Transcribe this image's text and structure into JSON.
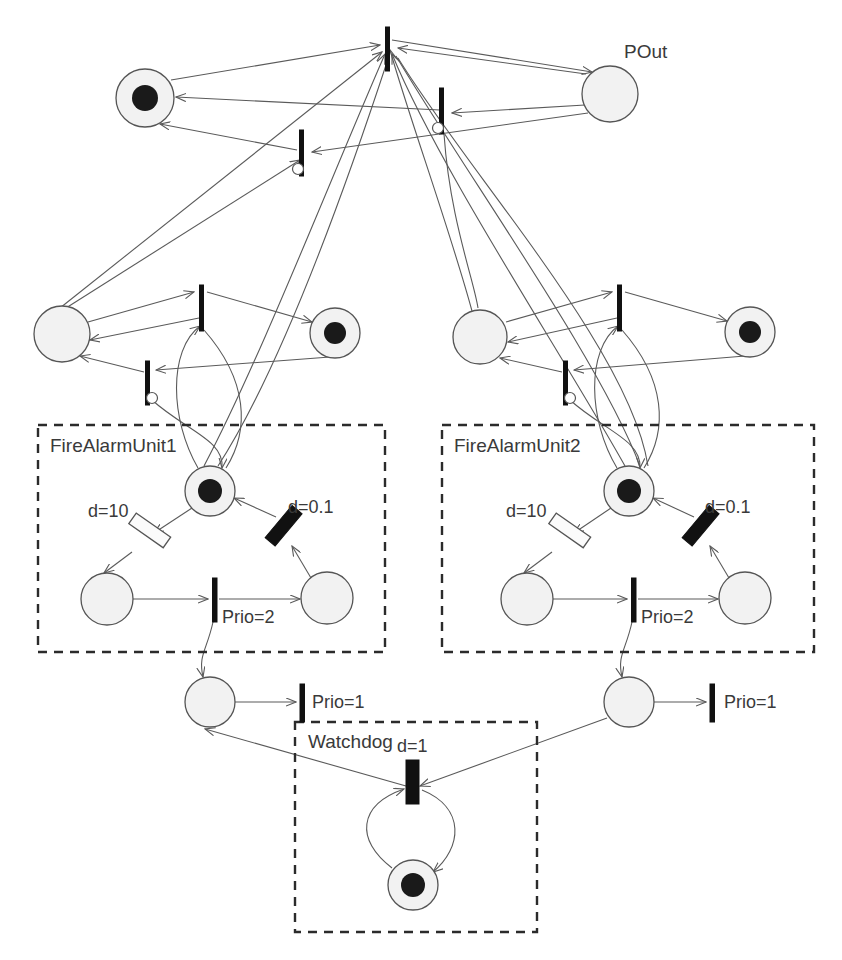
{
  "diagram": {
    "type": "petri-net",
    "colors": {
      "place_fill": "#f2f2f2",
      "place_stroke": "#555555",
      "token": "#1a1a1a",
      "transition_filled": "#111111",
      "transition_hollow": "#fbfbfb",
      "arc": "#5a5a5a",
      "group_border": "#2b2b2b",
      "text": "#3a3a3a",
      "background": "#ffffff"
    }
  },
  "labels": {
    "pout": "POut",
    "fire_alarm_unit_1": "FireAlarmUnit1",
    "fire_alarm_unit_2": "FireAlarmUnit2",
    "watchdog": "Watchdog",
    "d_10_u1": "d=10",
    "d_01_u1": "d=0.1",
    "prio_2_u1": "Prio=2",
    "d_10_u2": "d=10",
    "d_01_u2": "d=0.1",
    "prio_2_u2": "Prio=2",
    "prio_1_left": "Prio=1",
    "prio_1_right": "Prio=1",
    "d_1_watchdog": "d=1"
  },
  "places": [
    {
      "id": "p-top-left",
      "cx": 145,
      "cy": 98,
      "r": 29,
      "tokens": 1,
      "label": ""
    },
    {
      "id": "p-out",
      "cx": 610,
      "cy": 94,
      "r": 28,
      "tokens": 0,
      "label": "POut"
    },
    {
      "id": "p-mid-left-1",
      "cx": 62,
      "cy": 334,
      "r": 28,
      "tokens": 0,
      "label": ""
    },
    {
      "id": "p-mid-right-1",
      "cx": 335,
      "cy": 333,
      "r": 25,
      "tokens": 1,
      "label": ""
    },
    {
      "id": "p-mid-left-2",
      "cx": 480,
      "cy": 337,
      "r": 27,
      "tokens": 0,
      "label": ""
    },
    {
      "id": "p-mid-right-2",
      "cx": 750,
      "cy": 332,
      "r": 25,
      "tokens": 1,
      "label": ""
    },
    {
      "id": "p-u1-top",
      "cx": 210,
      "cy": 491,
      "r": 25,
      "tokens": 1,
      "label": ""
    },
    {
      "id": "p-u1-left",
      "cx": 107,
      "cy": 599,
      "r": 26,
      "tokens": 0,
      "label": ""
    },
    {
      "id": "p-u1-right",
      "cx": 327,
      "cy": 598,
      "r": 26,
      "tokens": 0,
      "label": ""
    },
    {
      "id": "p-u2-top",
      "cx": 629,
      "cy": 491,
      "r": 25,
      "tokens": 1,
      "label": ""
    },
    {
      "id": "p-u2-left",
      "cx": 527,
      "cy": 599,
      "r": 26,
      "tokens": 0,
      "label": ""
    },
    {
      "id": "p-u2-right",
      "cx": 745,
      "cy": 598,
      "r": 26,
      "tokens": 0,
      "label": ""
    },
    {
      "id": "p-bottom-left",
      "cx": 210,
      "cy": 702,
      "r": 25,
      "tokens": 0,
      "label": ""
    },
    {
      "id": "p-bottom-right",
      "cx": 629,
      "cy": 702,
      "r": 25,
      "tokens": 0,
      "label": ""
    },
    {
      "id": "p-watchdog",
      "cx": 413,
      "cy": 885,
      "r": 25,
      "tokens": 1,
      "label": ""
    }
  ],
  "transitions": [
    {
      "id": "t-top-main",
      "x": 388,
      "y": 27,
      "h": 44,
      "style": "thin",
      "label": "",
      "inhibitor": false
    },
    {
      "id": "t-top-right",
      "x": 442,
      "y": 88,
      "h": 46,
      "style": "thin",
      "label": "",
      "inhibitor": true
    },
    {
      "id": "t-top-left",
      "x": 302,
      "y": 130,
      "h": 46,
      "style": "thin",
      "label": "",
      "inhibitor": true
    },
    {
      "id": "t-mid1-up",
      "x": 202,
      "y": 285,
      "h": 46,
      "style": "thin",
      "label": "",
      "inhibitor": false
    },
    {
      "id": "t-mid1-down",
      "x": 148,
      "y": 361,
      "h": 44,
      "style": "thin",
      "label": "",
      "inhibitor": true
    },
    {
      "id": "t-mid2-up",
      "x": 620,
      "y": 285,
      "h": 46,
      "style": "thin",
      "label": "",
      "inhibitor": false
    },
    {
      "id": "t-mid2-down",
      "x": 566,
      "y": 361,
      "h": 44,
      "style": "thin",
      "label": "",
      "inhibitor": true
    },
    {
      "id": "t-u1-d10",
      "x": 141,
      "y": 524,
      "h": 42,
      "style": "hollow",
      "label": "d=10",
      "inhibitor": false
    },
    {
      "id": "t-u1-d01",
      "x": 283,
      "y": 523,
      "h": 42,
      "style": "thick",
      "label": "d=0.1",
      "inhibitor": false
    },
    {
      "id": "t-u1-prio2",
      "x": 215,
      "y": 578,
      "h": 44,
      "style": "thin",
      "label": "Prio=2",
      "inhibitor": false
    },
    {
      "id": "t-u2-d10",
      "x": 561,
      "y": 524,
      "h": 42,
      "style": "hollow",
      "label": "d=10",
      "inhibitor": false
    },
    {
      "id": "t-u2-d01",
      "x": 700,
      "y": 523,
      "h": 42,
      "style": "thick",
      "label": "d=0.1",
      "inhibitor": false
    },
    {
      "id": "t-u2-prio2",
      "x": 634,
      "y": 578,
      "h": 44,
      "style": "thin",
      "label": "Prio=2",
      "inhibitor": false
    },
    {
      "id": "t-prio1-left",
      "x": 302,
      "y": 684,
      "h": 38,
      "style": "thin",
      "label": "Prio=1",
      "inhibitor": false
    },
    {
      "id": "t-prio1-right",
      "x": 712,
      "y": 684,
      "h": 38,
      "style": "thin",
      "label": "Prio=1",
      "inhibitor": false
    },
    {
      "id": "t-watchdog-d1",
      "x": 413,
      "y": 760,
      "h": 44,
      "style": "thick",
      "label": "d=1",
      "inhibitor": false
    }
  ],
  "groups": [
    {
      "id": "group-unit1",
      "label": "FireAlarmUnit1",
      "x": 38,
      "y": 425,
      "w": 347,
      "h": 227
    },
    {
      "id": "group-unit2",
      "label": "FireAlarmUnit2",
      "x": 442,
      "y": 425,
      "w": 372,
      "h": 227
    },
    {
      "id": "group-watchdog",
      "label": "Watchdog",
      "x": 295,
      "y": 722,
      "w": 242,
      "h": 210
    }
  ]
}
